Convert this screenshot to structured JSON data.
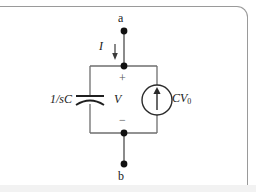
{
  "figure": {
    "type": "circuit-diagram",
    "terminals": [
      {
        "id": "a",
        "label": "a",
        "position": "top"
      },
      {
        "id": "b",
        "label": "b",
        "position": "bottom"
      }
    ],
    "labels": {
      "current": "I",
      "voltage": "V",
      "plus_sign": "+",
      "minus_sign": "−",
      "capacitor_impedance": "1/sC",
      "current_source": "CV",
      "current_source_subscript": "0"
    },
    "components": [
      {
        "name": "capacitor-impedance",
        "label": "1/sC",
        "kind": "impedance-capacitor",
        "branch": "left"
      },
      {
        "name": "current-source",
        "label": "CV0",
        "kind": "independent-current-source",
        "branch": "right",
        "arrow_direction": "up"
      }
    ],
    "current_arrow_direction": "down",
    "colors": {
      "wire": "#6e6e6e",
      "node": "#111111",
      "text": "#1a1a1a",
      "frame": "#9a9a9a",
      "sign": "#555555",
      "background": "#ffffff",
      "band": "#f2f2f2"
    }
  }
}
